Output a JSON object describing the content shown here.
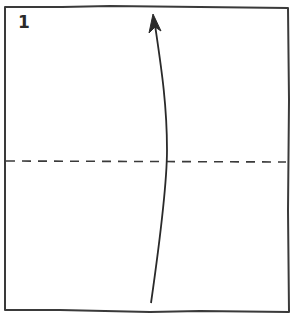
{
  "diagram": {
    "type": "origami-fold-step",
    "step_number": "1",
    "colors": {
      "line": "#3a3a3a",
      "background": "#ffffff"
    },
    "elements": {
      "paper": "square sheet outline",
      "fold_line": "horizontal dashed valley-fold line across middle",
      "arrow": "curved arrow pointing upward from bottom edge to top edge"
    }
  }
}
